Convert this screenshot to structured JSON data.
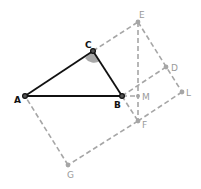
{
  "diagram": {
    "type": "geometry",
    "colors": {
      "triangle": "#111111",
      "construction": "#a6a6a6",
      "angle_fill": "#a8a8a8",
      "aux_label": "#9a9a9a",
      "main_label": "#111111"
    },
    "points": [
      {
        "name": "A",
        "x": 25,
        "y": 96,
        "role": "main"
      },
      {
        "name": "B",
        "x": 122,
        "y": 96,
        "role": "main"
      },
      {
        "name": "C",
        "x": 93,
        "y": 51,
        "role": "main"
      },
      {
        "name": "E",
        "x": 138,
        "y": 22,
        "role": "aux"
      },
      {
        "name": "D",
        "x": 166,
        "y": 67,
        "role": "aux"
      },
      {
        "name": "L",
        "x": 182,
        "y": 92,
        "role": "aux"
      },
      {
        "name": "M",
        "x": 138,
        "y": 96,
        "role": "aux"
      },
      {
        "name": "F",
        "x": 138,
        "y": 121,
        "role": "aux"
      },
      {
        "name": "G",
        "x": 68,
        "y": 165,
        "role": "aux"
      }
    ],
    "labels": {
      "A": "A",
      "B": "B",
      "C": "C",
      "D": "D",
      "E": "E",
      "F": "F",
      "G": "G",
      "L": "L",
      "M": "M"
    },
    "solid_segments": [
      [
        "A",
        "B"
      ],
      [
        "B",
        "C"
      ],
      [
        "C",
        "A"
      ]
    ],
    "dashed_segments": [
      [
        "C",
        "E"
      ],
      [
        "E",
        "L"
      ],
      [
        "B",
        "D"
      ],
      [
        "L",
        "F"
      ],
      [
        "F",
        "G"
      ],
      [
        "G",
        "A"
      ],
      [
        "E",
        "F"
      ],
      [
        "B",
        "M"
      ]
    ],
    "angle_marker": {
      "vertex": "C",
      "between": [
        "A",
        "B"
      ]
    }
  }
}
